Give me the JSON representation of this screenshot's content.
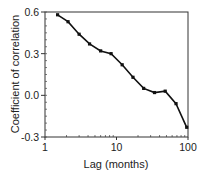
{
  "chart_data": {
    "type": "line",
    "title": "",
    "xlabel": "Lag (months)",
    "ylabel": "Coefficient of correlation",
    "xscale": "log",
    "xlim": [
      1,
      100
    ],
    "ylim": [
      -0.3,
      0.6
    ],
    "xticks": [
      "1",
      "10",
      "100"
    ],
    "yticks": [
      "0.6",
      "0.3",
      "0.0",
      "-0.3"
    ],
    "grid": false,
    "legend": null,
    "series": [
      {
        "name": "correlation",
        "color": "#111111",
        "marker": "square",
        "x": [
          1.5,
          2.1,
          3.0,
          4.2,
          6.0,
          8.4,
          12,
          17,
          24,
          34,
          48,
          68,
          96
        ],
        "y": [
          0.58,
          0.53,
          0.44,
          0.37,
          0.32,
          0.3,
          0.22,
          0.13,
          0.05,
          0.02,
          0.03,
          -0.06,
          -0.23
        ]
      }
    ]
  }
}
